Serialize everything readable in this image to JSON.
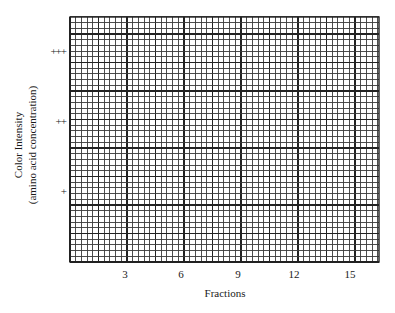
{
  "chart_data": {
    "type": "line",
    "title": "",
    "xlabel": "Fractions",
    "ylabel": [
      "Color Intensity",
      "(amino acid concentration)"
    ],
    "x_ticks": [
      3,
      6,
      9,
      12,
      15
    ],
    "y_ticks": [
      "+",
      "++",
      "+++"
    ],
    "xlim": [
      0,
      16.3
    ],
    "ylim": [
      0,
      3.5
    ],
    "grid": true,
    "series": [],
    "note": "Blank graph-paper grid with no plotted data"
  },
  "labels": {
    "xtitle": "Fractions",
    "ytitle_line1": "Color Intensity",
    "ytitle_line2": "(amino acid concentration)",
    "xticks": [
      "3",
      "6",
      "9",
      "12",
      "15"
    ],
    "yticks": [
      "+",
      "++",
      "+++"
    ]
  },
  "colors": {
    "grid_line": "#3a3a3a",
    "grid_major": "#222222",
    "background": "#ffffff",
    "text": "#1a1a1a"
  }
}
